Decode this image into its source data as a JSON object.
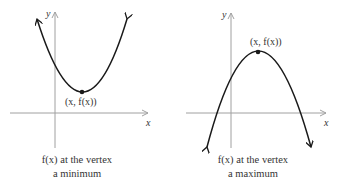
{
  "diagrams": [
    {
      "name": "minimum",
      "x_axis_label": "x",
      "y_axis_label": "y",
      "vertex_label": "(x, f(x))",
      "caption_line1": "f(x) at the vertex",
      "caption_line2": "a minimum"
    },
    {
      "name": "maximum",
      "x_axis_label": "x",
      "y_axis_label": "y",
      "vertex_label": "(x, f(x))",
      "caption_line1": "f(x) at the vertex",
      "caption_line2": "a maximum"
    }
  ],
  "colors": {
    "axis": "#a0a0a0",
    "curve": "#1a1a1a",
    "text": "#333333"
  }
}
